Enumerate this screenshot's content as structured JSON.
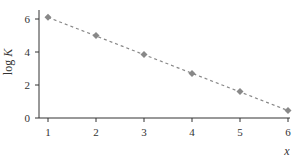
{
  "chart_data": {
    "type": "scatter",
    "title": "",
    "xlabel": "x",
    "ylabel": "log K",
    "x": [
      1,
      2,
      3,
      4,
      5,
      6
    ],
    "series": [
      {
        "name": "log K",
        "values": [
          6.1,
          5.0,
          3.85,
          2.7,
          1.6,
          0.45
        ],
        "marker": "diamond",
        "color": "#888888",
        "trendline": "dashed"
      }
    ],
    "xticks": [
      "1",
      "2",
      "3",
      "4",
      "5",
      "6"
    ],
    "yticks": [
      "0",
      "2",
      "4",
      "6"
    ],
    "xlim": [
      0.8,
      6
    ],
    "ylim": [
      0,
      6.5
    ],
    "grid": false,
    "legend": "none"
  }
}
